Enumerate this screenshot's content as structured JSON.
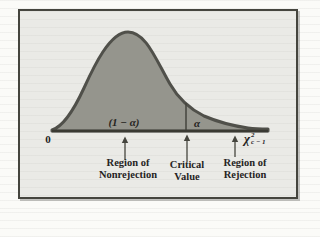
{
  "figure": {
    "description": "Chi-square distribution curve showing rejection and nonrejection regions",
    "colors": {
      "figure_background": "#eaeae6",
      "frame_border": "#45453e",
      "curve_fill": "#95958d",
      "curve_stroke": "#50504a",
      "axis": "#3a3a33",
      "text": "#26241f"
    }
  },
  "labels": {
    "origin": "0",
    "nonrejection_area": "(1 − α)",
    "alpha": "α",
    "chi": {
      "base": "χ",
      "sup": "2",
      "sub": "c − 1"
    }
  },
  "captions": {
    "nonrejection": {
      "line1": "Region of",
      "line2": "Nonrejection"
    },
    "critical": {
      "line1": "Critical",
      "line2": "Value"
    },
    "rejection": {
      "line1": "Region of",
      "line2": "Rejection"
    }
  }
}
